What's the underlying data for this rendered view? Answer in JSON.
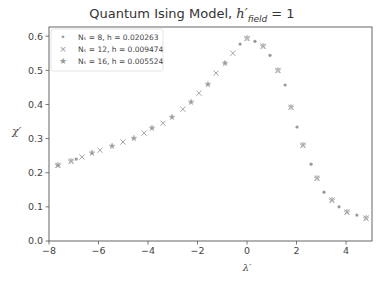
{
  "chart_data": {
    "type": "scatter",
    "title_parts": {
      "main": "Quantum Ising Model, ",
      "symbol": "h′",
      "subscript": "field",
      "suffix": " = 1"
    },
    "xlabel": "λ′",
    "ylabel": "χ′",
    "xlim": [
      -8.0,
      5.05
    ],
    "ylim": [
      0.0,
      0.627
    ],
    "xticks": [
      -8,
      -6,
      -4,
      -2,
      0,
      2,
      4
    ],
    "xtick_labels": [
      "−8",
      "−6",
      "−4",
      "−2",
      "0",
      "2",
      "4"
    ],
    "yticks": [
      0.0,
      0.1,
      0.2,
      0.3,
      0.4,
      0.5,
      0.6
    ],
    "ytick_labels": [
      "0.0",
      "0.1",
      "0.2",
      "0.3",
      "0.4",
      "0.5",
      "0.6"
    ],
    "grid": false,
    "legend_position": "upper left",
    "series": [
      {
        "name": "N_s = 8, h = 0.020263",
        "legend_label": "N_s = 8, h = 0.020263",
        "marker": "dot",
        "color": "#999999",
        "x": [
          -7.64,
          -6.9,
          -6.26,
          -5.45,
          -4.57,
          -3.84,
          -3.03,
          -2.26,
          -1.58,
          -0.89,
          -0.28,
          0.32,
          0.93,
          1.54,
          2.02,
          2.59,
          3.11,
          3.72,
          4.44
        ],
        "y": [
          0.222,
          0.24,
          0.258,
          0.278,
          0.301,
          0.331,
          0.363,
          0.407,
          0.459,
          0.521,
          0.577,
          0.585,
          0.544,
          0.457,
          0.334,
          0.225,
          0.143,
          0.1,
          0.076
        ]
      },
      {
        "name": "N_s = 12, h = 0.009474",
        "legend_label": "N_s = 12, h = 0.009474",
        "marker": "x",
        "color": "#999999",
        "x": [
          -7.64,
          -7.11,
          -6.67,
          -5.94,
          -5.01,
          -4.16,
          -3.39,
          -2.59,
          -1.94,
          -1.25,
          -0.57,
          0.0,
          0.65,
          1.25,
          1.78,
          2.26,
          2.83,
          3.43,
          4.04,
          4.81
        ],
        "y": [
          0.222,
          0.234,
          0.246,
          0.266,
          0.29,
          0.316,
          0.345,
          0.386,
          0.433,
          0.492,
          0.55,
          0.594,
          0.571,
          0.5,
          0.392,
          0.281,
          0.184,
          0.12,
          0.085,
          0.067
        ]
      },
      {
        "name": "N_s = 16, h = 0.005524",
        "legend_label": "N_s = 16, h = 0.005524",
        "marker": "star",
        "color": "#aaaaaa",
        "x": [
          -7.64,
          -7.11,
          -6.26,
          -5.45,
          -4.57,
          -3.84,
          -3.03,
          -2.26,
          -1.58,
          -0.89,
          0.0,
          0.65,
          1.25,
          1.78,
          2.26,
          2.83,
          3.43,
          4.04,
          4.81
        ],
        "y": [
          0.222,
          0.234,
          0.258,
          0.278,
          0.301,
          0.331,
          0.363,
          0.407,
          0.459,
          0.521,
          0.594,
          0.571,
          0.5,
          0.392,
          0.281,
          0.184,
          0.12,
          0.085,
          0.067
        ]
      }
    ]
  },
  "title": {
    "main": "Quantum Ising Model, ",
    "symbol": "h′",
    "subscript": "field",
    "suffix": " = 1"
  },
  "axes": {
    "xlabel": "λ′",
    "ylabel": "χ′"
  },
  "legend": [
    {
      "marker": "•",
      "label": "Nₛ = 8, h = 0.020263"
    },
    {
      "marker": "×",
      "label": "Nₛ = 12, h = 0.009474"
    },
    {
      "marker": "★",
      "label": "Nₛ = 16, h = 0.005524"
    }
  ]
}
